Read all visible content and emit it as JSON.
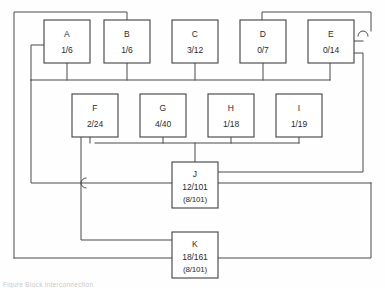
{
  "diagram": {
    "stroke_color": "#4a4a4a",
    "box_fill": "#ffffff",
    "background": "#fefefe",
    "nodes": [
      {
        "id": "A",
        "label": "A",
        "value": "1/6",
        "sub": "",
        "x": 44,
        "y": 20,
        "w": 46,
        "h": 43
      },
      {
        "id": "B",
        "label": "B",
        "value": "1/6",
        "sub": "",
        "x": 104,
        "y": 20,
        "w": 46,
        "h": 43
      },
      {
        "id": "C",
        "label": "C",
        "value": "3/12",
        "sub": "",
        "x": 172,
        "y": 20,
        "w": 46,
        "h": 43
      },
      {
        "id": "D",
        "label": "D",
        "value": "0/7",
        "sub": "",
        "x": 240,
        "y": 20,
        "w": 46,
        "h": 43
      },
      {
        "id": "E",
        "label": "E",
        "value": "0/14",
        "sub": "",
        "x": 308,
        "y": 20,
        "w": 46,
        "h": 43
      },
      {
        "id": "F",
        "label": "F",
        "value": "2/24",
        "sub": "",
        "x": 72,
        "y": 94,
        "w": 46,
        "h": 43
      },
      {
        "id": "G",
        "label": "G",
        "value": "4/40",
        "sub": "",
        "x": 140,
        "y": 94,
        "w": 46,
        "h": 43
      },
      {
        "id": "H",
        "label": "H",
        "value": "1/18",
        "sub": "",
        "x": 208,
        "y": 94,
        "w": 46,
        "h": 43
      },
      {
        "id": "I",
        "label": "I",
        "value": "1/19",
        "sub": "",
        "x": 276,
        "y": 94,
        "w": 46,
        "h": 43
      },
      {
        "id": "J",
        "label": "J",
        "value": "12/101",
        "sub": "(8/101)",
        "x": 172,
        "y": 162,
        "w": 46,
        "h": 46
      },
      {
        "id": "K",
        "label": "K",
        "value": "18/161",
        "sub": "(8/101)",
        "x": 172,
        "y": 232,
        "w": 46,
        "h": 46
      }
    ],
    "wires": [
      {
        "name": "top-bus-left-outer",
        "d": "M 14 258 L 14 12 L 127 12 L 127 20"
      },
      {
        "name": "top-bus-right-outer",
        "d": "M 262 20 L 262 12 L 371 12 L 371 31"
      },
      {
        "name": "upper-row-bus",
        "d": "M 31 80 L 330 80"
      },
      {
        "name": "drop-A",
        "d": "M 67 63 L 67 80"
      },
      {
        "name": "drop-B",
        "d": "M 127 63 L 127 80"
      },
      {
        "name": "drop-C",
        "d": "M 195 63 L 195 80"
      },
      {
        "name": "drop-D",
        "d": "M 263 63 L 263 80"
      },
      {
        "name": "drop-E",
        "d": "M 330 63 L 330 80"
      },
      {
        "name": "left-inner-riser",
        "d": "M 31 80 L 31 45 L 44 45"
      },
      {
        "name": "left-inner-down",
        "d": "M 31 80 L 31 183 L 172 183"
      },
      {
        "name": "mid-row-bus",
        "d": "M 95 143 L 299 143"
      },
      {
        "name": "drop-F",
        "d": "M 90 137 L 90 143"
      },
      {
        "name": "drop-G",
        "d": "M 163 137 L 163 143"
      },
      {
        "name": "drop-H",
        "d": "M 231 137 L 231 143"
      },
      {
        "name": "drop-I",
        "d": "M 299 137 L 299 143"
      },
      {
        "name": "bus-to-J",
        "d": "M 195 143 L 195 162"
      },
      {
        "name": "F-long-vertical",
        "d": "M 81 137 L 81 240 L 172 240"
      },
      {
        "name": "J-right-upper",
        "d": "M 218 172 L 363 172 L 363 53 L 354 53"
      },
      {
        "name": "J-right-lower",
        "d": "M 218 183 L 371 183"
      },
      {
        "name": "K-right-out",
        "d": "M 218 258 L 371 258 L 371 183"
      },
      {
        "name": "K-left-outer-in",
        "d": "M 14 258 L 172 258"
      },
      {
        "name": "E-tap-inner",
        "d": "M 354 41 L 363 41"
      }
    ],
    "hops": [
      {
        "name": "hop-right-rail",
        "cx": 363,
        "cy": 31,
        "r": 5,
        "orient": "up"
      },
      {
        "name": "hop-j-bus",
        "cx": 81,
        "cy": 183,
        "r": 5,
        "orient": "left"
      }
    ],
    "caption": "Figure  Block interconnection"
  }
}
